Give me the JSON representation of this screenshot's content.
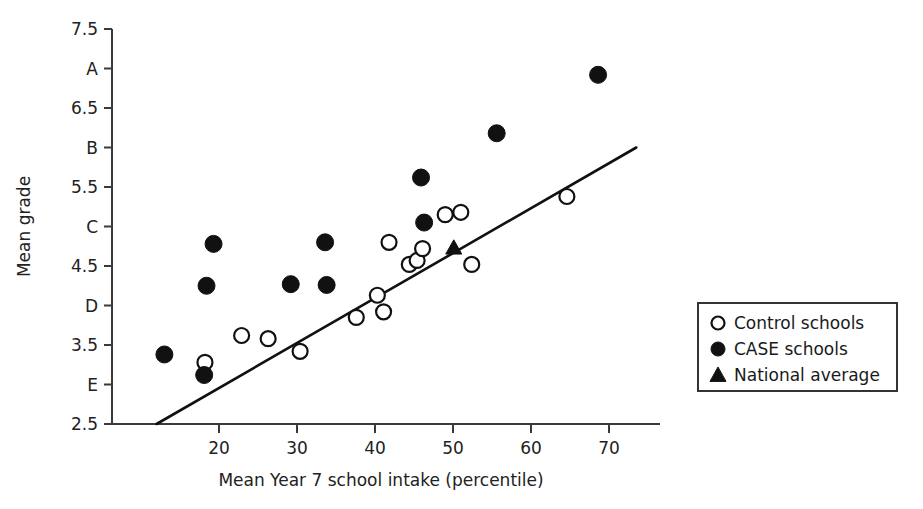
{
  "chart_data": {
    "type": "scatter",
    "title": "",
    "xlabel": "Mean Year 7 school intake (percentile)",
    "ylabel": "Mean grade",
    "xlim": [
      12,
      74
    ],
    "ylim": [
      2.5,
      7.5
    ],
    "grid": false,
    "x_ticks": [
      {
        "value": 20,
        "label": "20"
      },
      {
        "value": 30,
        "label": "30"
      },
      {
        "value": 40,
        "label": "40"
      },
      {
        "value": 50,
        "label": "50"
      },
      {
        "value": 60,
        "label": "60"
      },
      {
        "value": 70,
        "label": "70"
      }
    ],
    "y_ticks": [
      {
        "value": 7.5,
        "label": "7.5"
      },
      {
        "value": 7.0,
        "label": "A"
      },
      {
        "value": 6.5,
        "label": "6.5"
      },
      {
        "value": 6.0,
        "label": "B"
      },
      {
        "value": 5.5,
        "label": "5.5"
      },
      {
        "value": 5.0,
        "label": "C"
      },
      {
        "value": 4.5,
        "label": "4.5"
      },
      {
        "value": 4.0,
        "label": "D"
      },
      {
        "value": 3.5,
        "label": "3.5"
      },
      {
        "value": 3.0,
        "label": "E"
      },
      {
        "value": 2.5,
        "label": "2.5"
      }
    ],
    "legend_position": "right",
    "legend": [
      {
        "marker": "open-circle",
        "label": "Control schools"
      },
      {
        "marker": "filled-circle",
        "label": "CASE schools"
      },
      {
        "marker": "filled-triangle",
        "label": "National average"
      }
    ],
    "series": [
      {
        "name": "Control schools",
        "marker": "open-circle",
        "points": [
          [
            18.2,
            3.28
          ],
          [
            22.9,
            3.62
          ],
          [
            26.3,
            3.58
          ],
          [
            30.4,
            3.42
          ],
          [
            37.6,
            3.85
          ],
          [
            40.3,
            4.13
          ],
          [
            41.1,
            3.92
          ],
          [
            41.8,
            4.8
          ],
          [
            44.4,
            4.52
          ],
          [
            45.4,
            4.57
          ],
          [
            46.1,
            4.72
          ],
          [
            49.0,
            5.15
          ],
          [
            51.0,
            5.18
          ],
          [
            52.4,
            4.52
          ],
          [
            64.6,
            5.38
          ]
        ]
      },
      {
        "name": "CASE schools",
        "marker": "filled-circle",
        "points": [
          [
            13.0,
            3.38
          ],
          [
            18.1,
            3.12
          ],
          [
            19.3,
            4.78
          ],
          [
            18.4,
            4.25
          ],
          [
            29.2,
            4.27
          ],
          [
            33.8,
            4.26
          ],
          [
            33.6,
            4.8
          ],
          [
            46.3,
            5.05
          ],
          [
            45.9,
            5.62
          ],
          [
            55.6,
            6.18
          ],
          [
            68.6,
            6.92
          ]
        ]
      },
      {
        "name": "National average",
        "marker": "filled-triangle",
        "points": [
          [
            50.1,
            4.73
          ]
        ]
      }
    ],
    "fit_line": {
      "x1": 12.0,
      "y1": 2.5,
      "x2": 73.5,
      "y2": 6.0
    }
  }
}
